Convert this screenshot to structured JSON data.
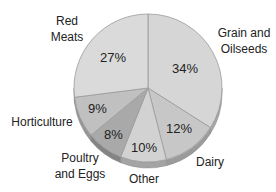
{
  "chart_data": {
    "type": "pie",
    "title": "",
    "style": "3d-tilted grayscale",
    "slices": [
      {
        "label": "Grain and Oilseeds",
        "value": 34,
        "display": "34%",
        "color": "#d6d6d6"
      },
      {
        "label": "Dairy",
        "value": 12,
        "display": "12%",
        "color": "#c7c7c7"
      },
      {
        "label": "Other",
        "value": 10,
        "display": "10%",
        "color": "#d2d2d2"
      },
      {
        "label": "Poultry and Eggs",
        "value": 8,
        "display": "8%",
        "color": "#a9a9a9"
      },
      {
        "label": "Horticulture",
        "value": 9,
        "display": "9%",
        "color": "#c0c0c0"
      },
      {
        "label": "Red Meats",
        "value": 27,
        "display": "27%",
        "color": "#dadada"
      }
    ]
  },
  "labels": {
    "grain_line1": "Grain and",
    "grain_line2": "Oilseeds",
    "dairy": "Dairy",
    "other": "Other",
    "poultry_line1": "Poultry",
    "poultry_line2": "and Eggs",
    "horticulture": "Horticulture",
    "redmeats_line1": "Red",
    "redmeats_line2": "Meats"
  },
  "percents": {
    "grain": "34%",
    "dairy": "12%",
    "other": "10%",
    "poultry": "8%",
    "horticulture": "9%",
    "redmeats": "27%"
  }
}
